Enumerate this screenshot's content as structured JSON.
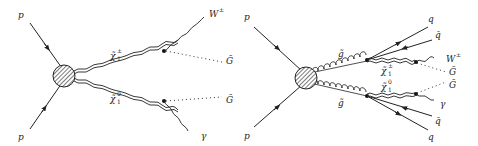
{
  "figure": {
    "colors": {
      "line": "#222222",
      "blob_fill": "#bbbbbb",
      "background": "#ffffff"
    }
  },
  "diagram_left": {
    "incoming": [
      {
        "label": "p"
      },
      {
        "label": "p"
      }
    ],
    "propagators": [
      {
        "label": "χ̃",
        "sup": "±",
        "sub": "1",
        "type": "double-wavy"
      },
      {
        "label": "χ̃",
        "sup": "0",
        "sub": "1",
        "type": "double-wavy"
      }
    ],
    "outgoing": [
      {
        "label": "W",
        "sup": "±",
        "type": "wavy"
      },
      {
        "label": "G̃",
        "type": "dotted"
      },
      {
        "label": "G̃",
        "type": "dotted"
      },
      {
        "label": "γ",
        "type": "wavy"
      }
    ]
  },
  "diagram_right": {
    "incoming": [
      {
        "label": "p"
      },
      {
        "label": "p"
      }
    ],
    "propagators": [
      {
        "label": "g̃",
        "type": "gluon-curly"
      },
      {
        "label": "g̃",
        "type": "gluon-curly"
      },
      {
        "label": "χ̃",
        "sup": "±",
        "sub": "1",
        "type": "double-wavy"
      },
      {
        "label": "χ̃",
        "sup": "0",
        "sub": "1",
        "type": "double-wavy"
      }
    ],
    "outgoing": [
      {
        "label": "q",
        "type": "fermion"
      },
      {
        "label": "q̄",
        "type": "fermion"
      },
      {
        "label": "W",
        "sup": "±",
        "type": "wavy"
      },
      {
        "label": "G̃",
        "type": "dotted"
      },
      {
        "label": "G̃",
        "type": "dotted"
      },
      {
        "label": "γ",
        "type": "wavy"
      },
      {
        "label": "q̄",
        "type": "fermion"
      },
      {
        "label": "q",
        "type": "fermion"
      }
    ]
  }
}
